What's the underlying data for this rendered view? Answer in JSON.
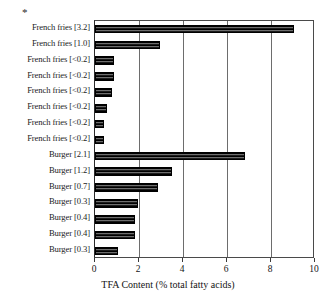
{
  "chart_data": {
    "type": "bar",
    "orientation": "horizontal",
    "title": "",
    "xlabel": "TFA Content (% total fatty acids)",
    "ylabel": "",
    "xlim": [
      0,
      10
    ],
    "xticks": [
      0,
      2,
      4,
      6,
      8,
      10
    ],
    "xtick_labels": [
      "0",
      "2",
      "4",
      "6",
      "8",
      "10"
    ],
    "grid": "vertical",
    "legend": "none",
    "annotations": [
      "*"
    ],
    "categories": [
      "French fries [3.2]",
      "French fries [1.0]",
      "French fries [<0.2]",
      "French fries [<0.2]",
      "French fries [<0.2]",
      "French fries [<0.2]",
      "French fries [<0.2]",
      "French fries [<0.2]",
      "Burger [2.1]",
      "Burger [1.2]",
      "Burger [0.7]",
      "Burger [0.3]",
      "Burger [0.4]",
      "Burger [0.4]",
      "Burger [0.3]"
    ],
    "values": [
      9.05,
      2.95,
      0.86,
      0.86,
      0.77,
      0.55,
      0.4,
      0.4,
      6.8,
      3.5,
      2.85,
      1.95,
      1.8,
      1.8,
      1.05
    ]
  },
  "colors": {
    "bar_dark": "#000000",
    "bar_light": "#6e6e6e",
    "axis": "#3a3a3a",
    "grid": "#6d6d6d",
    "text": "#141414",
    "background": "#ffffff"
  }
}
